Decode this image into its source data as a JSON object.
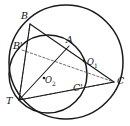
{
  "figure": {
    "kind": "geometry-diagram",
    "width": 130,
    "height": 126,
    "background_color": "#ffffff",
    "stroke_color": "#1a1a1a",
    "dashed_color": "#4a4a4a"
  },
  "circles": [
    {
      "name": "outer-circle",
      "center_label": "O1",
      "cx": 66,
      "cy": 62,
      "r": 57
    },
    {
      "name": "inner-circle",
      "center_label": "O2",
      "cx": 48,
      "cy": 74,
      "r": 39
    }
  ],
  "centers": [
    {
      "id": "O1",
      "letter": "O",
      "subscript": "1",
      "dot_x": 84,
      "dot_y": 61,
      "label_x": 87,
      "label_y": 62
    },
    {
      "id": "O2",
      "letter": "O",
      "subscript": "2",
      "dot_x": 44,
      "dot_y": 78,
      "label_x": 45,
      "label_y": 80
    }
  ],
  "points": [
    {
      "id": "B",
      "label": "B",
      "x": 30,
      "y": 24,
      "label_x": 21,
      "label_y": 11
    },
    {
      "id": "A",
      "label": "A",
      "x": 69,
      "y": 46,
      "label_x": 66,
      "label_y": 35
    },
    {
      "id": "C",
      "label": "C",
      "x": 114,
      "y": 82,
      "label_x": 117,
      "label_y": 76
    },
    {
      "id": "T",
      "label": "T",
      "x": 19,
      "y": 100,
      "label_x": 8,
      "label_y": 98
    },
    {
      "id": "Bp",
      "label": "B'",
      "x": 22,
      "y": 50,
      "label_x": 14,
      "label_y": 41
    },
    {
      "id": "Cp",
      "label": "C'",
      "x": 77,
      "y": 89,
      "label_x": 74,
      "label_y": 82
    }
  ],
  "solid_segments": [
    {
      "name": "segment-B-A-C",
      "from": "B",
      "to": "C"
    },
    {
      "name": "segment-B-T",
      "from": "B",
      "to": "T"
    },
    {
      "name": "segment-T-A",
      "from": "T",
      "to": "A"
    },
    {
      "name": "segment-T-C",
      "from": "T",
      "to": "C"
    }
  ],
  "dashed_segments": [
    {
      "name": "dashed-B-Bp-T",
      "from": "B",
      "to": "T"
    },
    {
      "name": "dashed-Bp-Cp",
      "from": "Bp",
      "to": "C"
    },
    {
      "name": "dashed-T-Cp-C",
      "from": "T",
      "to": "C"
    },
    {
      "name": "dashed-Bp-T",
      "from": "Bp",
      "to": "T"
    }
  ],
  "labels": {
    "B": "B",
    "A": "A",
    "C": "C",
    "T": "T",
    "B_prime": "B'",
    "C_prime": "C'",
    "O1_letter": "O",
    "O1_sub": "1",
    "O2_letter": "O",
    "O2_sub": "2"
  }
}
